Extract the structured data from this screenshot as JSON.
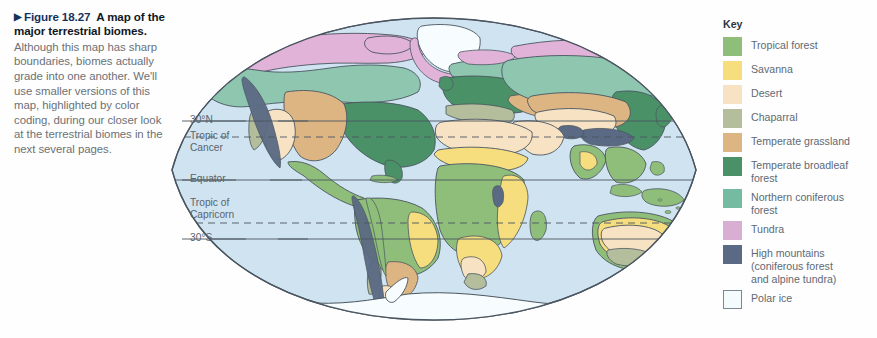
{
  "figure": {
    "marker": "▶",
    "number_label": "Figure 18.27",
    "title": "A map of the major terrestrial biomes.",
    "body": "Although this map has sharp boundaries, biomes actually grade into one another. We'll use smaller versions of this map, highlighted by color coding, during our closer look at the terrestrial biomes in the next several pages.",
    "accent_color": "#15315e",
    "body_color": "#6b7177"
  },
  "map": {
    "projection": "elliptical (Mollweide-like) world map",
    "ocean_color": "#cfe3f0",
    "outline_color": "#4a5560",
    "latitude_lines": [
      {
        "id": "lat-30n",
        "label": "30°N",
        "style": "solid",
        "y": 121
      },
      {
        "id": "tropic-cancer",
        "label": "Tropic of\nCancer",
        "style": "dashed",
        "y": 137
      },
      {
        "id": "equator",
        "label": "Equator",
        "style": "solid",
        "y": 180
      },
      {
        "id": "tropic-capricorn",
        "label": "Tropic of\nCapricorn",
        "style": "dashed",
        "y": 223
      },
      {
        "id": "lat-30s",
        "label": "30°S",
        "style": "solid",
        "y": 239
      }
    ],
    "label_color": "#5a646e"
  },
  "key": {
    "title": "Key",
    "items": [
      {
        "label": "Tropical forest",
        "color": "#8fbe7a",
        "outlined": false
      },
      {
        "label": "Savanna",
        "color": "#f6dd7e",
        "outlined": false
      },
      {
        "label": "Desert",
        "color": "#f7e3c4",
        "outlined": false
      },
      {
        "label": "Chaparral",
        "color": "#b4bd9c",
        "outlined": false
      },
      {
        "label": "Temperate grassland",
        "color": "#ddb583",
        "outlined": false
      },
      {
        "label": "Temperate broadleaf\nforest",
        "color": "#4b9168",
        "outlined": false
      },
      {
        "label": "Northern coniferous\nforest",
        "color": "#74bba2",
        "outlined": false
      },
      {
        "label": "Tundra",
        "color": "#d9aed3",
        "outlined": false
      },
      {
        "label": "High mountains\n(coniferous forest\nand alpine tundra)",
        "color": "#5b6a84",
        "outlined": false
      },
      {
        "label": "Polar ice",
        "color": "#f4fbfd",
        "outlined": true
      }
    ]
  }
}
